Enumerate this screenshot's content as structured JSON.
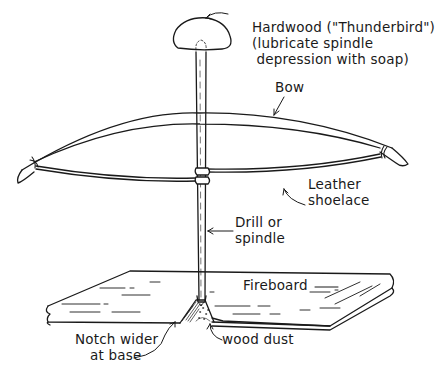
{
  "diagram": {
    "colors": {
      "ink": "#1a1a1a",
      "background": "#ffffff"
    },
    "labels": {
      "hardwood_line1": "Hardwood (\"Thunderbird\")",
      "hardwood_line2": "(lubricate spindle",
      "hardwood_line3": " depression with soap)",
      "bow": "Bow",
      "shoelace_line1": "Leather",
      "shoelace_line2": "shoelace",
      "spindle_line1": "Drill or",
      "spindle_line2": "spindle",
      "fireboard": "Fireboard",
      "notch_line1": "Notch wider",
      "notch_line2": "at base",
      "wood_dust": "wood dust"
    },
    "parts": [
      {
        "id": "hardwood-cap",
        "label": "Hardwood (\"Thunderbird\")"
      },
      {
        "id": "bow",
        "label": "Bow"
      },
      {
        "id": "leather-shoelace",
        "label": "Leather shoelace"
      },
      {
        "id": "spindle",
        "label": "Drill or spindle"
      },
      {
        "id": "fireboard",
        "label": "Fireboard"
      },
      {
        "id": "notch",
        "label": "Notch wider at base"
      },
      {
        "id": "wood-dust",
        "label": "wood dust"
      }
    ]
  }
}
